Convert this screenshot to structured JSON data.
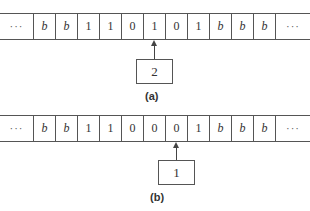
{
  "figure": {
    "panels": [
      {
        "label": "(a)",
        "tape": {
          "left_ellipsis": "···",
          "cells": [
            "b",
            "b",
            "1",
            "1",
            "0",
            "1",
            "0",
            "1",
            "b",
            "b",
            "b"
          ],
          "right_ellipsis": "···"
        },
        "head_position_index": 5,
        "state": "2"
      },
      {
        "label": "(b)",
        "tape": {
          "left_ellipsis": "···",
          "cells": [
            "b",
            "b",
            "1",
            "1",
            "0",
            "0",
            "0",
            "1",
            "b",
            "b",
            "b"
          ],
          "right_ellipsis": "···"
        },
        "head_position_index": 6,
        "state": "1"
      }
    ]
  }
}
